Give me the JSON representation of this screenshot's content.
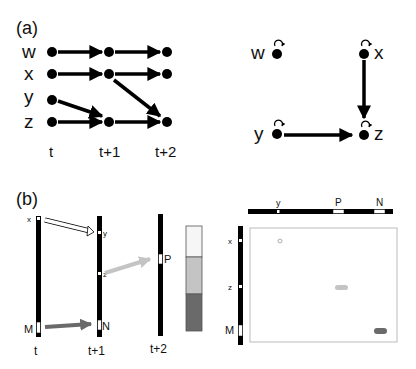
{
  "panel_a": {
    "label": "(a)",
    "variables": [
      "w",
      "x",
      "y",
      "z"
    ],
    "time_labels": [
      "t",
      "t+1",
      "t+2"
    ],
    "edges_unrolled": [
      {
        "from": "w_t",
        "to": "w_t+1"
      },
      {
        "from": "w_t+1",
        "to": "w_t+2"
      },
      {
        "from": "x_t",
        "to": "x_t+1"
      },
      {
        "from": "x_t+1",
        "to": "x_t+2"
      },
      {
        "from": "y_t",
        "to": "z_t+1"
      },
      {
        "from": "x_t+1",
        "to": "z_t+2"
      },
      {
        "from": "z_t",
        "to": "z_t+1"
      },
      {
        "from": "z_t+1",
        "to": "z_t+2"
      }
    ],
    "summary_graph": {
      "nodes": [
        "w",
        "x",
        "y",
        "z"
      ],
      "self_loops": [
        "w",
        "x",
        "y",
        "z"
      ],
      "edges": [
        {
          "from": "x",
          "to": "z"
        },
        {
          "from": "y",
          "to": "z"
        }
      ]
    }
  },
  "panel_b": {
    "label": "(b)",
    "time_labels": [
      "t",
      "t+1",
      "t+2"
    ],
    "bar_t_labels": [
      "x",
      "M"
    ],
    "bar_t1_labels": [
      "y",
      "z",
      "N"
    ],
    "bar_t2_labels": [
      "P"
    ],
    "heatmap_top_labels": [
      "y",
      "P",
      "N"
    ],
    "heatmap_left_labels": [
      "x",
      "z",
      "M"
    ],
    "colors": {
      "white": "#ffffff",
      "light": "#c4c4c4",
      "dark": "#6a6a6a"
    }
  }
}
